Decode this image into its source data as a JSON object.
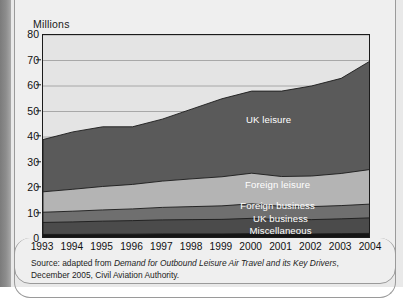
{
  "figure": {
    "units_label": "Millions",
    "source_prefix": "Source: adapted from ",
    "source_title": "Demand for Outbound Leisure Air Travel and its Key Drivers",
    "source_suffix": ", December 2005, Civil Aviation Authority."
  },
  "chart_data": {
    "type": "area",
    "title": "",
    "subtitle": "",
    "xlabel": "",
    "ylabel": "Millions",
    "categories": [
      "1993",
      "1994",
      "1995",
      "1996",
      "1997",
      "1998",
      "1999",
      "2000",
      "2001",
      "2002",
      "2003",
      "2004"
    ],
    "x": [
      1993,
      1994,
      1995,
      1996,
      1997,
      1998,
      1999,
      2000,
      2001,
      2002,
      2003,
      2004
    ],
    "ylim": [
      0,
      80
    ],
    "xlim": [
      1993,
      2004
    ],
    "yticks": [
      0,
      10,
      20,
      30,
      40,
      50,
      60,
      70,
      80
    ],
    "grid": true,
    "grid_axis": "y",
    "legend_position": "inline-labels",
    "stacked": true,
    "stack_order_bottom_to_top": [
      "Miscellaneous",
      "UK business",
      "Foreign business",
      "Foreign leisure",
      "UK leisure"
    ],
    "series": [
      {
        "name": "Miscellaneous",
        "color": "#151515",
        "values": [
          1.8,
          1.8,
          1.9,
          1.9,
          2.0,
          2.0,
          2.0,
          2.1,
          2.0,
          2.0,
          2.1,
          2.2
        ]
      },
      {
        "name": "UK business",
        "color": "#4b4b4b",
        "values": [
          4.7,
          4.9,
          5.1,
          5.3,
          5.5,
          5.6,
          5.7,
          6.0,
          5.6,
          5.6,
          5.8,
          6.1
        ]
      },
      {
        "name": "Foreign business",
        "color": "#6f6f6f",
        "values": [
          4.0,
          4.2,
          4.4,
          4.6,
          4.9,
          5.1,
          5.3,
          5.7,
          5.2,
          5.1,
          5.2,
          5.4
        ]
      },
      {
        "name": "Foreign leisure",
        "color": "#b4b4b4",
        "values": [
          8.0,
          8.6,
          9.2,
          9.6,
          10.3,
          10.9,
          11.4,
          12.0,
          11.7,
          12.0,
          12.6,
          13.6
        ]
      },
      {
        "name": "UK leisure",
        "color": "#5a5a5a",
        "values": [
          20.5,
          22.5,
          23.4,
          22.6,
          24.3,
          27.4,
          30.6,
          32.2,
          33.5,
          35.3,
          37.3,
          42.7
        ]
      }
    ],
    "cumulative_totals": [
      39.0,
      42.0,
      44.0,
      44.0,
      47.0,
      51.0,
      55.0,
      58.0,
      58.0,
      60.0,
      63.0,
      70.0
    ],
    "boundaries_cumulative": {
      "Miscellaneous": [
        1.8,
        1.8,
        1.9,
        1.9,
        2.0,
        2.0,
        2.0,
        2.1,
        2.0,
        2.0,
        2.1,
        2.2
      ],
      "UK business": [
        6.5,
        6.7,
        7.0,
        7.2,
        7.5,
        7.6,
        7.7,
        8.1,
        7.6,
        7.6,
        7.9,
        8.3
      ],
      "Foreign business": [
        10.5,
        10.9,
        11.4,
        11.8,
        12.4,
        12.7,
        13.0,
        13.8,
        12.8,
        12.7,
        13.1,
        13.7
      ],
      "Foreign leisure": [
        18.5,
        19.5,
        20.6,
        21.4,
        22.7,
        23.6,
        24.4,
        25.8,
        24.5,
        24.7,
        25.7,
        27.3
      ],
      "UK leisure": [
        39.0,
        42.0,
        44.0,
        44.0,
        47.0,
        51.0,
        55.0,
        58.0,
        58.0,
        60.0,
        63.0,
        70.0
      ]
    },
    "series_inline_labels": [
      {
        "name": "UK leisure",
        "x_year": 2000.6,
        "y_value": 46.5
      },
      {
        "name": "Foreign leisure",
        "x_year": 2000.9,
        "y_value": 21.3
      },
      {
        "name": "Foreign business",
        "x_year": 2000.9,
        "y_value": 13.0
      },
      {
        "name": "UK business",
        "x_year": 2001.0,
        "y_value": 8.0
      },
      {
        "name": "Miscellaneous",
        "x_year": 2001.0,
        "y_value": 3.1
      }
    ],
    "colors": {
      "plot_background": "#e4e4e4",
      "gridline": "#a0a0a0",
      "axis": "#1b1b1b",
      "label_text": "#ffffff"
    }
  }
}
